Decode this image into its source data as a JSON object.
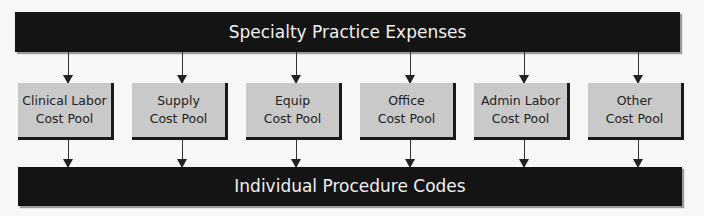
{
  "diagram": {
    "top": {
      "label": "Specialty Practice Expenses"
    },
    "pools": [
      {
        "line1": "Clinical Labor",
        "line2": "Cost Pool"
      },
      {
        "line1": "Supply",
        "line2": "Cost Pool"
      },
      {
        "line1": "Equip",
        "line2": "Cost Pool"
      },
      {
        "line1": "Office",
        "line2": "Cost Pool"
      },
      {
        "line1": "Admin Labor",
        "line2": "Cost Pool"
      },
      {
        "line1": "Other",
        "line2": "Cost Pool"
      }
    ],
    "bottom": {
      "label": "Individual Procedure Codes"
    },
    "colors": {
      "bar": "#141414",
      "pool": "#c9c9c9",
      "background": "#f7f7f5"
    }
  }
}
